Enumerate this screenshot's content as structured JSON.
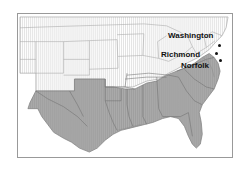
{
  "figure": {
    "type": "map",
    "region": "Southern United States",
    "frame_border_color": "#999999",
    "background_color": "#ffffff"
  },
  "map": {
    "shaded_region_color": "#a9a9a9",
    "unshaded_region_color": "#fbfbfb",
    "state_border_color": "#8a8a8a",
    "coastline_color": "#777777",
    "hatch_color": "#dcdcdc"
  },
  "cities": [
    {
      "name": "Washington",
      "label": "Washington",
      "dot_color": "#111111",
      "label_position": "left-of-dot"
    },
    {
      "name": "Richmond",
      "label": "Richmond",
      "dot_color": "#111111",
      "label_position": "left-of-dot"
    },
    {
      "name": "Norfolk",
      "label": "Norfolk",
      "dot_color": "#111111",
      "label_position": "below-left-of-dot"
    }
  ]
}
